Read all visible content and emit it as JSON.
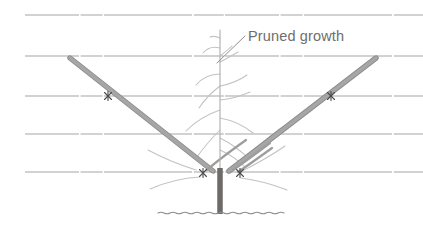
{
  "figure": {
    "background_color": "#ffffff",
    "width": 423,
    "height": 225
  },
  "annotations": [
    {
      "id": "pruned-growth",
      "label": "Pruned growth",
      "text_color": "#6e6e6e",
      "font_size": 14.5,
      "text_x": 248,
      "text_y": 41,
      "leader_from_x": 245,
      "leader_from_y": 36,
      "leader_to_x": 217,
      "leader_to_y": 63,
      "leader_color": "#8e8e8e"
    }
  ],
  "wires": {
    "name": "trellis-wires",
    "color": "#9b9b9b",
    "stroke_width": 0.9,
    "lines": [
      {
        "id": "wire-1",
        "y": 15,
        "x1": 25,
        "x2": 423
      },
      {
        "id": "wire-2",
        "y": 56,
        "x1": 25,
        "x2": 423
      },
      {
        "id": "wire-3",
        "y": 96,
        "x1": 25,
        "x2": 423
      },
      {
        "id": "wire-4",
        "y": 134,
        "x1": 25,
        "x2": 423
      },
      {
        "id": "wire-5",
        "y": 172,
        "x1": 25,
        "x2": 423
      }
    ]
  },
  "ground": {
    "name": "ground-line",
    "y": 213,
    "x1": 158,
    "x2": 287,
    "color": "#8c8c8c",
    "stroke_width": 1.1
  },
  "trunk": {
    "name": "tree-trunk",
    "color": "#6d6a67",
    "x": 220,
    "top_y": 168,
    "bottom_y": 214,
    "width": 5.5
  },
  "arms": {
    "color": "#9e9e9e",
    "edge_color": "#7d7d7d",
    "stroke_width": 4.2,
    "left": {
      "id": "arm-left",
      "x1": 70,
      "y1": 58,
      "x2": 213,
      "y2": 171
    },
    "right": {
      "id": "arm-right",
      "x1": 376,
      "y1": 58,
      "x2": 229,
      "y2": 171
    }
  },
  "ties": {
    "color": "#4a4a4a",
    "wire_tie_color": "#6a6a6a",
    "points": [
      {
        "id": "tie-left-wire3",
        "x": 108,
        "y": 96
      },
      {
        "id": "tie-right-wire3",
        "x": 331,
        "y": 96
      },
      {
        "id": "tie-left-base",
        "x": 203,
        "y": 173
      },
      {
        "id": "tie-right-base",
        "x": 240,
        "y": 173
      }
    ]
  },
  "central_stem": {
    "name": "central-leader",
    "color": "#b4b4b4",
    "stroke_width": 1.2,
    "x": 220,
    "top_y": 30,
    "bottom_y": 172
  },
  "pruned_shoots": {
    "name": "pruned-side-shoots",
    "color": "#c0c0c0",
    "stroke_width": 1.1,
    "count": 10,
    "description": "Fine light-grey curved lateral shoots pruned back along the central leader and main arms"
  },
  "legend": {
    "caption": ""
  }
}
